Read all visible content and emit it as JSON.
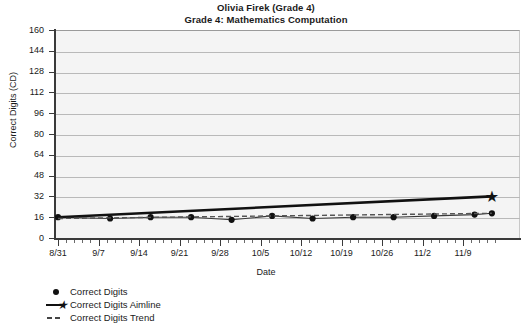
{
  "chart_data": {
    "type": "line",
    "title": "Olivia Firek (Grade 4)",
    "subtitle": "Grade 4: Mathematics Computation",
    "xlabel": "Date",
    "ylabel": "Correct Digits (CD)",
    "ylim": [
      0,
      160
    ],
    "ytick_step": 16,
    "yticks": [
      0,
      16,
      32,
      48,
      64,
      80,
      96,
      112,
      128,
      144,
      160
    ],
    "ytick_labels": [
      "0",
      "16",
      "32",
      "48",
      "64",
      "80",
      "96",
      "112",
      "128",
      "144",
      "160"
    ],
    "categories": [
      "8/31",
      "9/7",
      "9/14",
      "9/21",
      "9/28",
      "10/5",
      "10/12",
      "10/19",
      "10/26",
      "11/2",
      "11/9"
    ],
    "grid": "horizontal",
    "legend_position": "below-left",
    "series": [
      {
        "name": "Correct Digits",
        "style": "markers",
        "marker": "circle",
        "color": "#111111",
        "x": [
          "8/31",
          "9/9",
          "9/16",
          "9/23",
          "9/30",
          "10/7",
          "10/14",
          "10/21",
          "10/28",
          "11/4",
          "11/11",
          "11/14"
        ],
        "values": [
          16,
          15,
          16,
          16,
          14,
          17,
          15,
          16,
          16,
          17,
          18,
          19
        ]
      },
      {
        "name": "Correct Digits Aimline",
        "style": "line",
        "marker": "star-endpoint",
        "color": "#111111",
        "x": [
          "8/31",
          "11/14"
        ],
        "values": [
          16,
          32
        ]
      },
      {
        "name": "Correct Digits Trend",
        "style": "dashed-line",
        "color": "#555555",
        "x": [
          "8/31",
          "11/14"
        ],
        "values": [
          15,
          19
        ]
      }
    ]
  },
  "legend": {
    "items": [
      {
        "label": "Correct Digits",
        "key": "dot-marker"
      },
      {
        "label": "Correct Digits Aimline",
        "key": "line-star-marker"
      },
      {
        "label": "Correct Digits Trend",
        "key": "dashed-marker"
      }
    ]
  }
}
